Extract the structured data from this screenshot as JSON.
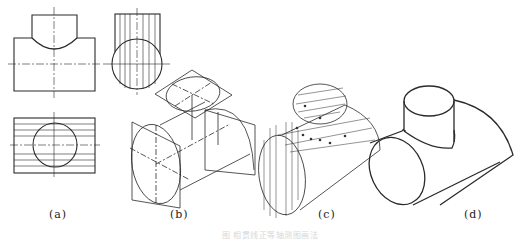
{
  "figure": {
    "panels": [
      {
        "id": "a",
        "label": "(a)",
        "content": "Orthographic views: front view, side view, top view with hatched cylinders"
      },
      {
        "id": "b",
        "label": "(b)",
        "content": "Isometric construction of ellipses via rhombus method"
      },
      {
        "id": "c",
        "label": "(c)",
        "content": "Locating intersection curve points with auxiliary lines"
      },
      {
        "id": "d",
        "label": "(d)",
        "content": "Finished isometric drawing of the tee intersection"
      }
    ],
    "caption": "图 相贯线正等轴测图画法"
  },
  "colors": {
    "line": "#2a2a2a",
    "thin": "#555555",
    "background": "#ffffff"
  }
}
